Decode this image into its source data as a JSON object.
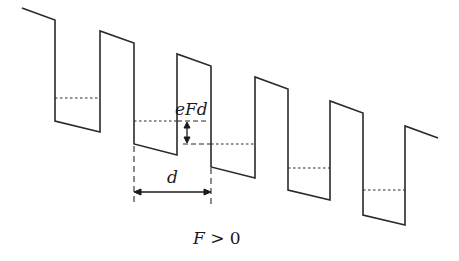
{
  "diagram": {
    "type": "superlattice-band-diagram",
    "colors": {
      "line": "#2a2a2a",
      "background": "#ffffff"
    },
    "labels": {
      "energy_drop": "eFd",
      "period": "d",
      "field_var": "F",
      "field_rel": " > 0"
    },
    "band_profile_points": "22,8 55,20 55,121 100,132 100,31 134,43 134,144 177,155 177,54 211,66 211,167 255,178 255,77 288,89 288,190 330,200 330,101 363,113 363,215 405,225 405,126 438,138",
    "well_levels": [
      {
        "x1": 55,
        "x2": 100,
        "y": 98
      },
      {
        "x1": 134,
        "x2": 177,
        "y": 121
      },
      {
        "x1": 211,
        "x2": 255,
        "y": 144
      },
      {
        "x1": 288,
        "x2": 330,
        "y": 168
      },
      {
        "x1": 363,
        "x2": 405,
        "y": 190
      }
    ]
  }
}
